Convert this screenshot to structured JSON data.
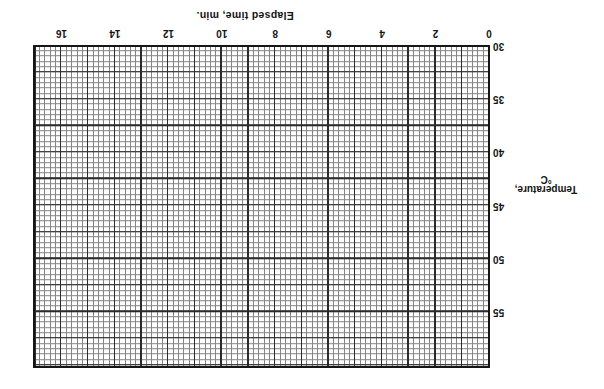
{
  "figure": {
    "kind": "scanned graph paper chart, blank (no data series plotted)",
    "presentation": {
      "rotation_deg": 180
    }
  },
  "chart_data": {
    "type": "line",
    "title": "",
    "series": [],
    "grid_on": true,
    "x_axis": {
      "label": "Elapsed time, min.",
      "ticks": [
        0,
        2,
        4,
        6,
        8,
        10,
        12,
        14,
        16
      ],
      "range_min": 0,
      "range_max": 17.1,
      "minor_step": 0.2,
      "major_step": 1
    },
    "y_axis": {
      "label": "Temperature, °C",
      "label_lines": [
        "Temperature,",
        "°C"
      ],
      "ticks": [
        30,
        35,
        40,
        45,
        50,
        55
      ],
      "range_min": 30,
      "range_max": 60.4,
      "minor_step": 0.5,
      "major_step": 2.5
    }
  },
  "colors": {
    "background": "#ffffff",
    "fine_grid_line": "#848484",
    "major_grid_line": "#2b2b2b",
    "grid_border": "#161616",
    "text": "#141414"
  }
}
